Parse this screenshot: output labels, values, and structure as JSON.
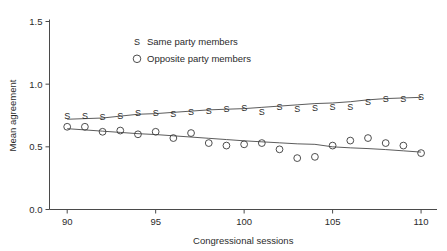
{
  "chart_data": {
    "type": "scatter",
    "title": "",
    "xlabel": "Congressional sessions",
    "ylabel": "Mean agreement",
    "xlim": [
      89.0,
      110.9
    ],
    "ylim": [
      0.0,
      1.5
    ],
    "xticks": [
      90,
      95,
      100,
      105,
      110
    ],
    "xtick_labels": [
      "90",
      "95",
      "100",
      "105",
      "110"
    ],
    "yticks": [
      0.0,
      0.5,
      1.0,
      1.5
    ],
    "ytick_labels": [
      "0.0",
      "0.5",
      "1.0",
      "1.5"
    ],
    "grid": false,
    "legend_position": "upper-center",
    "legend": [
      {
        "marker": "S",
        "label": "Same party members"
      },
      {
        "marker": "O",
        "label": "Opposite party members"
      }
    ],
    "x": [
      90,
      91,
      92,
      93,
      94,
      95,
      96,
      97,
      98,
      99,
      100,
      101,
      102,
      103,
      104,
      105,
      106,
      107,
      108,
      109,
      110
    ],
    "series": [
      {
        "name": "Same party members",
        "marker": "S",
        "values": [
          0.75,
          0.75,
          0.74,
          0.75,
          0.77,
          0.77,
          0.76,
          0.78,
          0.79,
          0.8,
          0.81,
          0.78,
          0.82,
          0.8,
          0.81,
          0.82,
          0.82,
          0.86,
          0.88,
          0.88,
          0.9
        ],
        "trend": [
          0.72,
          0.725,
          0.73,
          0.745,
          0.76,
          0.765,
          0.775,
          0.785,
          0.795,
          0.8,
          0.805,
          0.815,
          0.825,
          0.835,
          0.845,
          0.85,
          0.86,
          0.875,
          0.885,
          0.89,
          0.895
        ]
      },
      {
        "name": "Opposite party members",
        "marker": "O",
        "values": [
          0.66,
          0.66,
          0.62,
          0.63,
          0.6,
          0.62,
          0.57,
          0.61,
          0.53,
          0.51,
          0.52,
          0.53,
          0.48,
          0.41,
          0.42,
          0.51,
          0.55,
          0.57,
          0.53,
          0.51,
          0.45
        ],
        "trend": [
          0.645,
          0.635,
          0.625,
          0.615,
          0.605,
          0.598,
          0.588,
          0.578,
          0.568,
          0.558,
          0.548,
          0.54,
          0.532,
          0.524,
          0.52,
          0.5,
          0.492,
          0.486,
          0.478,
          0.468,
          0.458
        ]
      }
    ]
  }
}
